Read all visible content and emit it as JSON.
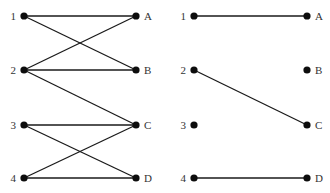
{
  "caption": "",
  "colors": {
    "edge": "#1a1a1a",
    "node": "#0d0d0d",
    "label": "#333333"
  },
  "graphs": [
    {
      "name": "left-bipartite-graph",
      "left_nodes": [
        {
          "id": "1",
          "label": "1",
          "x": 24,
          "y": 16
        },
        {
          "id": "2",
          "label": "2",
          "x": 24,
          "y": 70
        },
        {
          "id": "3",
          "label": "3",
          "x": 24,
          "y": 125
        },
        {
          "id": "4",
          "label": "4",
          "x": 24,
          "y": 178
        }
      ],
      "right_nodes": [
        {
          "id": "A",
          "label": "A",
          "x": 136,
          "y": 16
        },
        {
          "id": "B",
          "label": "B",
          "x": 136,
          "y": 70
        },
        {
          "id": "C",
          "label": "C",
          "x": 136,
          "y": 125
        },
        {
          "id": "D",
          "label": "D",
          "x": 136,
          "y": 178
        }
      ],
      "edges": [
        [
          "1",
          "A"
        ],
        [
          "1",
          "B"
        ],
        [
          "2",
          "A"
        ],
        [
          "2",
          "B"
        ],
        [
          "2",
          "C"
        ],
        [
          "3",
          "C"
        ],
        [
          "3",
          "D"
        ],
        [
          "4",
          "C"
        ],
        [
          "4",
          "D"
        ]
      ]
    },
    {
      "name": "right-matching-graph",
      "left_nodes": [
        {
          "id": "1",
          "label": "1",
          "x": 194,
          "y": 16
        },
        {
          "id": "2",
          "label": "2",
          "x": 194,
          "y": 70
        },
        {
          "id": "3",
          "label": "3",
          "x": 194,
          "y": 125
        },
        {
          "id": "4",
          "label": "4",
          "x": 194,
          "y": 178
        }
      ],
      "right_nodes": [
        {
          "id": "A",
          "label": "A",
          "x": 307,
          "y": 16
        },
        {
          "id": "B",
          "label": "B",
          "x": 307,
          "y": 70
        },
        {
          "id": "C",
          "label": "C",
          "x": 307,
          "y": 125
        },
        {
          "id": "D",
          "label": "D",
          "x": 307,
          "y": 178
        }
      ],
      "edges": [
        [
          "1",
          "A"
        ],
        [
          "2",
          "C"
        ],
        [
          "4",
          "D"
        ]
      ]
    }
  ]
}
